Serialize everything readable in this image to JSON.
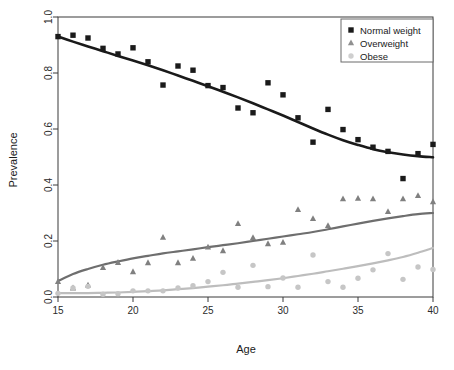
{
  "chart_data": {
    "type": "scatter",
    "title": "",
    "xlabel": "Age",
    "ylabel": "Prevalence",
    "xlim": [
      15,
      40
    ],
    "ylim": [
      0.0,
      1.0
    ],
    "xticks": [
      15,
      20,
      25,
      30,
      35,
      40
    ],
    "yticks": [
      "0.0",
      "0.2",
      "0.4",
      "0.6",
      "0.8",
      "1.0"
    ],
    "xtick_labels": [
      "15",
      "20",
      "25",
      "30",
      "35",
      "40"
    ],
    "grid": false,
    "legend_position": "top-right",
    "x": [
      15,
      16,
      17,
      18,
      19,
      20,
      21,
      22,
      23,
      24,
      25,
      26,
      27,
      28,
      29,
      30,
      31,
      32,
      33,
      34,
      35,
      36,
      37,
      38,
      39,
      40
    ],
    "series": [
      {
        "name": "Normal weight",
        "marker": "square",
        "color": "#1a1a1a",
        "line_color": "#1a1a1a",
        "values": [
          0.93,
          0.935,
          0.925,
          0.888,
          0.868,
          0.89,
          0.84,
          0.757,
          0.825,
          0.81,
          0.755,
          0.748,
          0.675,
          0.658,
          0.765,
          0.722,
          0.64,
          0.553,
          0.67,
          0.598,
          0.562,
          0.535,
          0.52,
          0.423,
          0.512,
          0.545
        ],
        "fit": [
          0.93,
          0.912,
          0.895,
          0.878,
          0.861,
          0.845,
          0.828,
          0.81,
          0.791,
          0.772,
          0.753,
          0.733,
          0.713,
          0.692,
          0.67,
          0.648,
          0.625,
          0.602,
          0.58,
          0.56,
          0.543,
          0.528,
          0.517,
          0.509,
          0.503,
          0.499
        ]
      },
      {
        "name": "Overweight",
        "marker": "triangle",
        "color": "#808080",
        "line_color": "#6e6e6e",
        "values": [
          0.055,
          0.032,
          0.042,
          0.105,
          0.123,
          0.09,
          0.122,
          0.213,
          0.122,
          0.138,
          0.178,
          0.165,
          0.262,
          0.212,
          0.19,
          0.195,
          0.312,
          0.28,
          0.255,
          0.35,
          0.352,
          0.35,
          0.305,
          0.35,
          0.362,
          0.34
        ],
        "fit": [
          0.057,
          0.082,
          0.1,
          0.115,
          0.127,
          0.138,
          0.147,
          0.156,
          0.163,
          0.17,
          0.178,
          0.185,
          0.192,
          0.2,
          0.208,
          0.216,
          0.224,
          0.232,
          0.242,
          0.252,
          0.262,
          0.272,
          0.281,
          0.289,
          0.296,
          0.3
        ]
      },
      {
        "name": "Obese",
        "marker": "circle",
        "color": "#c6c6c6",
        "line_color": "#bdbdbd",
        "values": [
          0.013,
          0.032,
          0.038,
          0.01,
          0.012,
          0.022,
          0.022,
          0.022,
          0.032,
          0.04,
          0.055,
          0.088,
          0.035,
          0.113,
          0.037,
          0.068,
          0.035,
          0.15,
          0.055,
          0.035,
          0.067,
          0.097,
          0.155,
          0.063,
          0.107,
          0.098
        ]
      }
    ],
    "obese_fit": [
      0.014,
      0.014,
      0.014,
      0.015,
      0.016,
      0.018,
      0.021,
      0.024,
      0.028,
      0.032,
      0.037,
      0.042,
      0.048,
      0.054,
      0.06,
      0.067,
      0.075,
      0.083,
      0.092,
      0.101,
      0.11,
      0.12,
      0.131,
      0.143,
      0.158,
      0.175
    ]
  },
  "legend": {
    "items": [
      {
        "label": "Normal weight",
        "marker": "square-icon",
        "color": "#1a1a1a"
      },
      {
        "label": "Overweight",
        "marker": "triangle-icon",
        "color": "#909090"
      },
      {
        "label": "Obese",
        "marker": "circle-icon",
        "color": "#cfcfcf"
      }
    ]
  }
}
